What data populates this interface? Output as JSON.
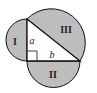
{
  "diagram": {
    "colors": {
      "fill": "#bdbdbd",
      "stroke": "#111111",
      "triangle_fill": "#ffffff"
    },
    "regions": {
      "I": "I",
      "II": "II",
      "III": "III"
    },
    "sides": {
      "a": "a",
      "b": "b"
    }
  }
}
